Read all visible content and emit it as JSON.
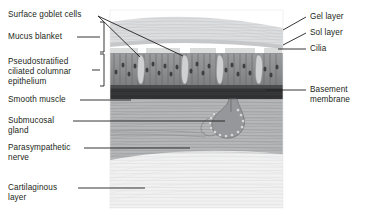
{
  "figure": {
    "kind": "labeled anatomical illustration",
    "illustration": {
      "name": "tracheal-bronchial-wall-cross-section",
      "frame": {
        "x": 110,
        "y": 10,
        "width": 173,
        "height": 198
      },
      "layers_top_to_bottom": [
        "Gel layer",
        "Sol layer",
        "Cilia",
        "Pseudostratified ciliated columnar epithelium",
        "Basement membrane",
        "Smooth muscle",
        "Submucosa with submucosal gland and parasympathetic nerve",
        "Cartilaginous layer"
      ]
    },
    "labels_left": [
      {
        "id": "surface-goblet-cells",
        "text": "Surface goblet cells",
        "x": 8,
        "y": 10
      },
      {
        "id": "mucus-blanket",
        "text": "Mucus blanket",
        "x": 8,
        "y": 34
      },
      {
        "id": "pseudostratified-ciliated-columnar-epithelium",
        "text": "Pseudostratified\nciliated columnar\nepithelium",
        "x": 8,
        "y": 58
      },
      {
        "id": "smooth-muscle",
        "text": "Smooth muscle",
        "x": 8,
        "y": 97
      },
      {
        "id": "submucosal-gland",
        "text": "Submucosal\ngland",
        "x": 8,
        "y": 118
      },
      {
        "id": "parasympathetic-nerve",
        "text": "Parasympathetic\nnerve",
        "x": 8,
        "y": 145
      },
      {
        "id": "cartilaginous-layer",
        "text": "Cartilaginous\nlayer",
        "x": 8,
        "y": 184
      }
    ],
    "labels_right": [
      {
        "id": "gel-layer",
        "text": "Gel layer",
        "x": 310,
        "y": 14
      },
      {
        "id": "sol-layer",
        "text": "Sol layer",
        "x": 310,
        "y": 30
      },
      {
        "id": "cilia",
        "text": "Cilia",
        "x": 310,
        "y": 46
      },
      {
        "id": "basement-membrane",
        "text": "Basement\nmembrane",
        "x": 310,
        "y": 87
      }
    ],
    "colors": {
      "background": "#ffffff",
      "text": "#231f20",
      "leader_line": "#231f20",
      "mucus_gel": "#d9dadb",
      "mucus_sol": "#c3c5c7",
      "epithelium": "#8d8f91",
      "epithelium_cell": "#a6a8ab",
      "basement_membrane": "#4c4d4f",
      "smooth_muscle": "#3a3b3d",
      "submucosa": "#b0b2b4",
      "gland": "#8a8c8e",
      "cartilage": "#efeff0"
    }
  }
}
